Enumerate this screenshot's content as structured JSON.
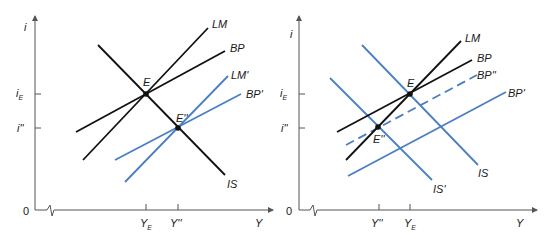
{
  "colors": {
    "black_curve": "#111111",
    "blue_curve": "#4a7fc1",
    "axis": "#555555"
  },
  "panels": [
    {
      "id": "left",
      "y_axis_label": "i",
      "x_axis_label": "Y",
      "origin_label": "0",
      "y_ticks": [
        {
          "label": "i",
          "sub": "E",
          "y": 94
        },
        {
          "label": "i''",
          "sub": "",
          "y": 128
        }
      ],
      "x_ticks": [
        {
          "label": "Y",
          "sub": "E",
          "x": 146
        },
        {
          "label": "Y''",
          "sub": "",
          "x": 178
        }
      ],
      "curves": [
        {
          "name": "IS",
          "color": "black",
          "style": "solid",
          "from": [
            98,
            45
          ],
          "to": [
            225,
            175
          ],
          "label_pos": [
            227,
            188
          ]
        },
        {
          "name": "LM",
          "color": "black",
          "style": "solid",
          "from": [
            83,
            160
          ],
          "to": [
            208,
            28
          ],
          "label_pos": [
            212,
            27
          ]
        },
        {
          "name": "BP",
          "color": "black",
          "style": "solid",
          "from": [
            76,
            132
          ],
          "to": [
            225,
            51
          ],
          "label_pos": [
            230,
            51
          ]
        },
        {
          "name": "LM'",
          "color": "blue",
          "style": "solid",
          "from": [
            125,
            182
          ],
          "to": [
            228,
            76
          ],
          "label_pos": [
            231,
            77
          ]
        },
        {
          "name": "BP'",
          "color": "blue",
          "style": "solid",
          "from": [
            115,
            160
          ],
          "to": [
            241,
            94
          ],
          "label_pos": [
            246,
            97
          ]
        }
      ],
      "points": [
        {
          "name": "E",
          "x": 146,
          "y": 94,
          "label_pos": [
            143,
            85
          ]
        },
        {
          "name": "E''",
          "x": 178,
          "y": 128,
          "label_pos": [
            175,
            121
          ]
        }
      ]
    },
    {
      "id": "right",
      "y_axis_label": "i",
      "x_axis_label": "Y",
      "origin_label": "0",
      "y_ticks": [
        {
          "label": "i",
          "sub": "E",
          "y": 94
        },
        {
          "label": "i''",
          "sub": "",
          "y": 128
        }
      ],
      "x_ticks": [
        {
          "label": "Y''",
          "sub": "",
          "x": 379
        },
        {
          "label": "Y",
          "sub": "E",
          "x": 410
        }
      ],
      "curves": [
        {
          "name": "LM",
          "color": "black",
          "style": "solid",
          "from": [
            346,
            160
          ],
          "to": [
            461,
            41
          ],
          "label_pos": [
            465,
            41
          ]
        },
        {
          "name": "BP",
          "color": "black",
          "style": "solid",
          "from": [
            337,
            132
          ],
          "to": [
            472,
            60
          ],
          "label_pos": [
            477,
            61
          ]
        },
        {
          "name": "BP''",
          "color": "blue",
          "style": "dashed",
          "from": [
            346,
            145
          ],
          "to": [
            477,
            75
          ],
          "label_pos": [
            477,
            77
          ]
        },
        {
          "name": "BP'",
          "color": "blue",
          "style": "solid",
          "from": [
            348,
            176
          ],
          "to": [
            506,
            92
          ],
          "label_pos": [
            508,
            95
          ]
        },
        {
          "name": "IS",
          "color": "blue",
          "style": "solid",
          "from": [
            362,
            45
          ],
          "to": [
            478,
            165
          ],
          "label_pos": [
            478,
            176
          ]
        },
        {
          "name": "IS'",
          "color": "blue",
          "style": "solid",
          "from": [
            330,
            78
          ],
          "to": [
            432,
            180
          ],
          "label_pos": [
            433,
            192
          ]
        }
      ],
      "points": [
        {
          "name": "E",
          "x": 410,
          "y": 94,
          "label_pos": [
            407,
            86
          ]
        },
        {
          "name": "E''",
          "x": 378,
          "y": 127,
          "label_pos": [
            373,
            143
          ]
        }
      ]
    }
  ],
  "labels": {
    "left_i": "i",
    "left_iE_main": "i",
    "left_iE_sub": "E",
    "left_ipp": "i''",
    "left_zero": "0",
    "left_YE_main": "Y",
    "left_YE_sub": "E",
    "left_Ypp": "Y''",
    "left_Y": "Y",
    "left_LM": "LM",
    "left_BP": "BP",
    "left_LMp": "LM'",
    "left_BPp": "BP'",
    "left_IS": "IS",
    "left_E": "E",
    "left_Epp": "E''",
    "right_i": "i",
    "right_iE_main": "i",
    "right_iE_sub": "E",
    "right_ipp": "i''",
    "right_zero": "0",
    "right_Ypp": "Y''",
    "right_YE_main": "Y",
    "right_YE_sub": "E",
    "right_Y": "Y",
    "right_LM": "LM",
    "right_BP": "BP",
    "right_BPpp": "BP''",
    "right_BPp": "BP'",
    "right_IS": "IS",
    "right_ISp": "IS'",
    "right_E": "E",
    "right_Epp": "E''"
  }
}
